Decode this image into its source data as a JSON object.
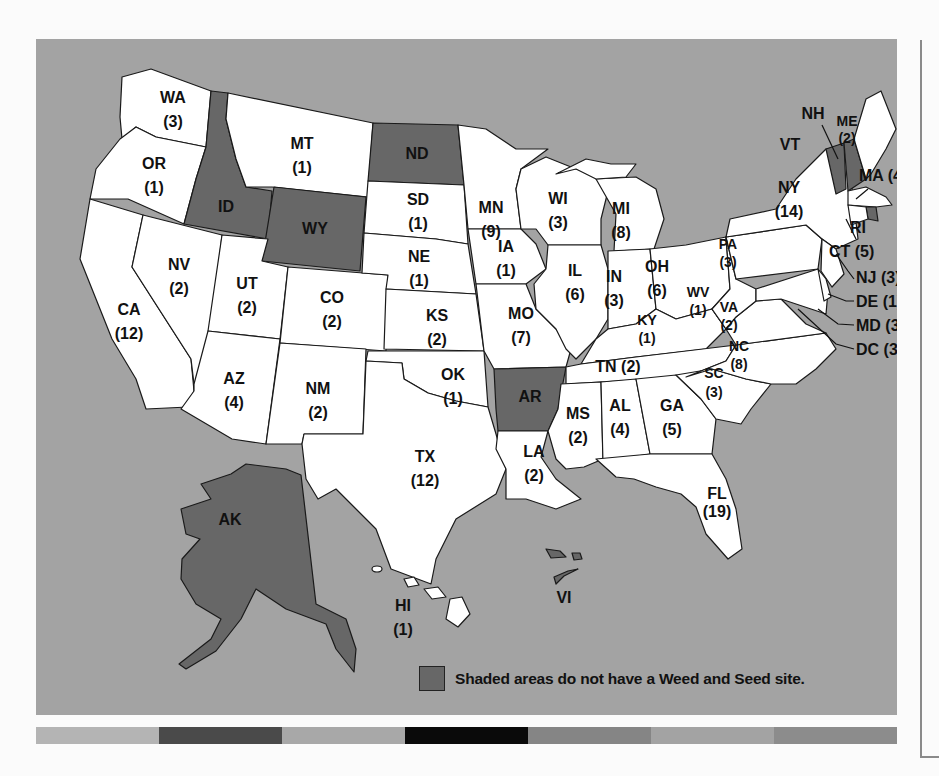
{
  "map": {
    "title_hidden": "",
    "colors": {
      "background": "#a3a3a3",
      "site_fill": "#ffffff",
      "no_site_fill": "#676767",
      "outline": "#1a1a1a"
    },
    "states": [
      {
        "code": "WA",
        "count": "(3)",
        "has_site": true
      },
      {
        "code": "OR",
        "count": "(1)",
        "has_site": true
      },
      {
        "code": "CA",
        "count": "(12)",
        "has_site": true
      },
      {
        "code": "ID",
        "count": "",
        "has_site": false
      },
      {
        "code": "NV",
        "count": "(2)",
        "has_site": true
      },
      {
        "code": "MT",
        "count": "(1)",
        "has_site": true
      },
      {
        "code": "WY",
        "count": "",
        "has_site": false
      },
      {
        "code": "UT",
        "count": "(2)",
        "has_site": true
      },
      {
        "code": "AZ",
        "count": "(4)",
        "has_site": true
      },
      {
        "code": "CO",
        "count": "(2)",
        "has_site": true
      },
      {
        "code": "NM",
        "count": "(2)",
        "has_site": true
      },
      {
        "code": "ND",
        "count": "",
        "has_site": false
      },
      {
        "code": "SD",
        "count": "(1)",
        "has_site": true
      },
      {
        "code": "NE",
        "count": "(1)",
        "has_site": true
      },
      {
        "code": "KS",
        "count": "(2)",
        "has_site": true
      },
      {
        "code": "OK",
        "count": "(1)",
        "has_site": true
      },
      {
        "code": "TX",
        "count": "(12)",
        "has_site": true
      },
      {
        "code": "MN",
        "count": "(9)",
        "has_site": true
      },
      {
        "code": "IA",
        "count": "(1)",
        "has_site": true
      },
      {
        "code": "MO",
        "count": "(7)",
        "has_site": true
      },
      {
        "code": "AR",
        "count": "",
        "has_site": false
      },
      {
        "code": "LA",
        "count": "(2)",
        "has_site": true
      },
      {
        "code": "WI",
        "count": "(3)",
        "has_site": true
      },
      {
        "code": "IL",
        "count": "(6)",
        "has_site": true
      },
      {
        "code": "MI",
        "count": "(8)",
        "has_site": true
      },
      {
        "code": "IN",
        "count": "(3)",
        "has_site": true
      },
      {
        "code": "OH",
        "count": "(6)",
        "has_site": true
      },
      {
        "code": "KY",
        "count": "(1)",
        "has_site": true
      },
      {
        "code": "TN",
        "count": "(2)",
        "has_site": true
      },
      {
        "code": "MS",
        "count": "(2)",
        "has_site": true
      },
      {
        "code": "AL",
        "count": "(4)",
        "has_site": true
      },
      {
        "code": "GA",
        "count": "(5)",
        "has_site": true
      },
      {
        "code": "FL",
        "count": "(19)",
        "has_site": true
      },
      {
        "code": "SC",
        "count": "(3)",
        "has_site": true
      },
      {
        "code": "NC",
        "count": "(8)",
        "has_site": true
      },
      {
        "code": "VA",
        "count": "(2)",
        "has_site": true
      },
      {
        "code": "WV",
        "count": "(1)",
        "has_site": true
      },
      {
        "code": "PA",
        "count": "(3)",
        "has_site": true
      },
      {
        "code": "NY",
        "count": "(14)",
        "has_site": true
      },
      {
        "code": "VT",
        "count": "",
        "has_site": false
      },
      {
        "code": "NH",
        "count": "",
        "has_site": false
      },
      {
        "code": "ME",
        "count": "(2)",
        "has_site": true
      },
      {
        "code": "MA",
        "count": "(4)",
        "has_site": true
      },
      {
        "code": "RI",
        "count": "",
        "has_site": false
      },
      {
        "code": "CT",
        "count": "(5)",
        "has_site": true
      },
      {
        "code": "NJ",
        "count": "(3)",
        "has_site": true
      },
      {
        "code": "DE",
        "count": "(1)",
        "has_site": true
      },
      {
        "code": "MD",
        "count": "(3)",
        "has_site": true
      },
      {
        "code": "DC",
        "count": "(3)",
        "has_site": true
      },
      {
        "code": "AK",
        "count": "",
        "has_site": false
      },
      {
        "code": "HI",
        "count": "(1)",
        "has_site": true
      },
      {
        "code": "VI",
        "count": "",
        "has_site": false
      }
    ],
    "labels": {
      "WA": "WA",
      "WA_n": "(3)",
      "OR": "OR",
      "OR_n": "(1)",
      "CA": "CA",
      "CA_n": "(12)",
      "ID": "ID",
      "NV": "NV",
      "NV_n": "(2)",
      "MT": "MT",
      "MT_n": "(1)",
      "WY": "WY",
      "UT": "UT",
      "UT_n": "(2)",
      "AZ": "AZ",
      "AZ_n": "(4)",
      "CO": "CO",
      "CO_n": "(2)",
      "NM": "NM",
      "NM_n": "(2)",
      "ND": "ND",
      "SD": "SD",
      "SD_n": "(1)",
      "NE": "NE",
      "NE_n": "(1)",
      "KS": "KS",
      "KS_n": "(2)",
      "OK": "OK",
      "OK_n": "(1)",
      "TX": "TX",
      "TX_n": "(12)",
      "MN": "MN",
      "MN_n": "(9)",
      "IA": "IA",
      "IA_n": "(1)",
      "MO": "MO",
      "MO_n": "(7)",
      "AR": "AR",
      "LA": "LA",
      "LA_n": "(2)",
      "WI": "WI",
      "WI_n": "(3)",
      "IL": "IL",
      "IL_n": "(6)",
      "MI": "MI",
      "MI_n": "(8)",
      "IN": "IN",
      "IN_n": "(3)",
      "OH": "OH",
      "OH_n": "(6)",
      "KY": "KY",
      "KY_n": "(1)",
      "TN": "TN (2)",
      "MS": "MS",
      "MS_n": "(2)",
      "AL": "AL",
      "AL_n": "(4)",
      "GA": "GA",
      "GA_n": "(5)",
      "FL": "FL",
      "FL_n": "(19)",
      "SC": "SC",
      "SC_n": "(3)",
      "NC": "NC",
      "NC_n": "(8)",
      "VA": "VA",
      "VA_n": "(2)",
      "WV": "WV",
      "WV_n": "(1)",
      "PA": "PA",
      "PA_n": "(3)",
      "NY": "NY",
      "NY_n": "(14)",
      "VT": "VT",
      "NH": "NH",
      "ME": "ME",
      "ME_n": "(2)",
      "MA": "MA (4)",
      "RI": "RI",
      "CT": "CT (5)",
      "NJ": "NJ (3)",
      "DE": "DE (1)",
      "MD": "MD (3)",
      "DC": "DC (3)",
      "AK": "AK",
      "HI": "HI",
      "HI_n": "(1)",
      "VI": "VI"
    }
  },
  "legend": {
    "text": "Shaded areas do not have a Weed and Seed site.",
    "swatch_color": "#676767"
  },
  "color_strip": [
    "#b4b4b4",
    "#4a4a4a",
    "#a8a8a8",
    "#0a0a0a",
    "#858585",
    "#a3a3a3",
    "#8c8c8c"
  ]
}
